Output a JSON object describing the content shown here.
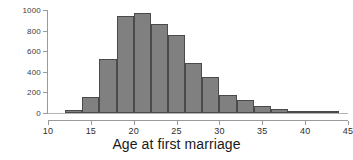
{
  "chart_data": {
    "type": "bar",
    "title": "",
    "xlabel": "Age at first marriage",
    "ylabel": "",
    "xlim": [
      10,
      45
    ],
    "ylim": [
      0,
      1000
    ],
    "grid": false,
    "legend": null,
    "bin_width": 2,
    "x_ticks": [
      10,
      15,
      20,
      25,
      30,
      35,
      40,
      45
    ],
    "x_tick_labels": [
      "10",
      "15",
      "20",
      "25",
      "30",
      "35",
      "40",
      "45"
    ],
    "y_ticks": [
      0,
      200,
      400,
      600,
      800,
      1000
    ],
    "y_tick_labels": [
      "0",
      "200",
      "400",
      "600",
      "800",
      "1000"
    ],
    "bar_color": "#808080",
    "bar_edge_color": "#4a4a4a",
    "axis_color": "#9a9a9a",
    "bins": [
      {
        "label": "10-12",
        "x0": 10,
        "x1": 12,
        "value": 0
      },
      {
        "label": "12-14",
        "x0": 12,
        "x1": 14,
        "value": 25
      },
      {
        "label": "14-16",
        "x0": 14,
        "x1": 16,
        "value": 160
      },
      {
        "label": "16-18",
        "x0": 16,
        "x1": 18,
        "value": 520
      },
      {
        "label": "18-20",
        "x0": 18,
        "x1": 20,
        "value": 945
      },
      {
        "label": "20-22",
        "x0": 20,
        "x1": 22,
        "value": 975
      },
      {
        "label": "22-24",
        "x0": 22,
        "x1": 24,
        "value": 865
      },
      {
        "label": "24-26",
        "x0": 24,
        "x1": 26,
        "value": 760
      },
      {
        "label": "26-28",
        "x0": 26,
        "x1": 28,
        "value": 485
      },
      {
        "label": "28-30",
        "x0": 28,
        "x1": 30,
        "value": 345
      },
      {
        "label": "30-32",
        "x0": 30,
        "x1": 32,
        "value": 175
      },
      {
        "label": "32-34",
        "x0": 32,
        "x1": 34,
        "value": 125
      },
      {
        "label": "34-36",
        "x0": 34,
        "x1": 36,
        "value": 65
      },
      {
        "label": "36-38",
        "x0": 36,
        "x1": 38,
        "value": 40
      },
      {
        "label": "38-40",
        "x0": 38,
        "x1": 40,
        "value": 20
      },
      {
        "label": "40-42",
        "x0": 40,
        "x1": 42,
        "value": 8
      },
      {
        "label": "42-44",
        "x0": 42,
        "x1": 44,
        "value": 3
      }
    ]
  }
}
